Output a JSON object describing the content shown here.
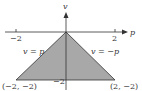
{
  "diagram": {
    "axes": {
      "x_label": "p",
      "y_label": "v",
      "x_ticks": [
        "−2",
        "2"
      ],
      "y_tick": "−2"
    },
    "region": {
      "fill_color": "#a8a8a8",
      "edge_color": "#333333",
      "left_edge_label": "v = p",
      "right_edge_label": "v = −p",
      "vertex_left": "(−2, −2)",
      "vertex_right": "(2, −2)"
    }
  }
}
